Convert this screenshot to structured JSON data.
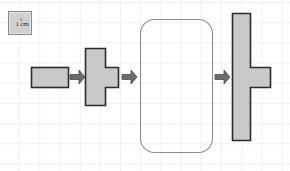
{
  "figure": {
    "background_color": "#ffffff",
    "grid": {
      "visible": true,
      "cell_size_px": 20,
      "line_color": "#f0f0f2"
    },
    "legend": {
      "label": "1 cm",
      "superscript": "2",
      "fill_color": "#d0d0d0",
      "stroke_color": "#8a8a8a"
    },
    "style": {
      "shape_fill": "#c9c9c9",
      "shape_stroke": "#2b2b2b",
      "outline_stroke": "#8d8d93",
      "arrow_fill": "#6b6b6b",
      "arrow_stroke": "#4a4a4a"
    },
    "shapes": [
      {
        "name": "rectangle-2x1",
        "kind": "rectangle",
        "filled": true,
        "cells": 2,
        "x": 31,
        "y": 67,
        "width": 37,
        "height": 20
      },
      {
        "name": "tee-shape-small",
        "kind": "polygon",
        "filled": true,
        "cells": 4,
        "points": "85,48 105,48 105,67 118,67 118,87 105,87 105,105 85,105"
      },
      {
        "name": "rounded-rectangle-outline",
        "kind": "rounded-rectangle",
        "filled": false,
        "x": 140,
        "y": 19,
        "width": 73,
        "height": 134,
        "corner_radius": 14
      },
      {
        "name": "tee-shape-tall",
        "kind": "polygon",
        "filled": true,
        "cells": 8,
        "points": "232,13 250,13 250,67 270,67 270,87 250,87 250,140 232,140"
      }
    ],
    "arrows": [
      {
        "name": "arrow-1",
        "x": 70,
        "y": 70,
        "width": 15,
        "height": 14
      },
      {
        "name": "arrow-2",
        "x": 122,
        "y": 70,
        "width": 15,
        "height": 14
      },
      {
        "name": "arrow-3",
        "x": 215,
        "y": 70,
        "width": 15,
        "height": 14
      }
    ]
  }
}
